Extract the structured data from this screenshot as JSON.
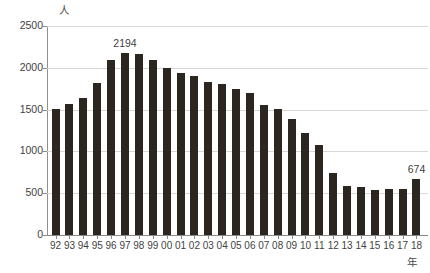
{
  "chart_data": {
    "type": "bar",
    "title": "",
    "subtitle": "",
    "xlabel": "年",
    "ylabel": "人",
    "ylim": [
      0,
      2500
    ],
    "ytick_labels": [
      "0",
      "500",
      "1000",
      "1500",
      "2000",
      "2500"
    ],
    "ytick_values": [
      0,
      500,
      1000,
      1500,
      2000,
      2500
    ],
    "grid": true,
    "legend": null,
    "categories": [
      "92",
      "93",
      "94",
      "95",
      "96",
      "97",
      "98",
      "99",
      "00",
      "01",
      "02",
      "03",
      "04",
      "05",
      "06",
      "07",
      "08",
      "09",
      "10",
      "11",
      "12",
      "13",
      "14",
      "15",
      "16",
      "17",
      "18"
    ],
    "values": [
      1502,
      1570,
      1634,
      1822,
      2097,
      2177,
      2170,
      2089,
      2002,
      1934,
      1897,
      1836,
      1812,
      1752,
      1702,
      1556,
      1512,
      1389,
      1221,
      1079,
      742,
      590,
      572,
      540,
      547,
      545,
      674
    ],
    "annotations": [
      {
        "category": "97",
        "value": 2194,
        "text": "2194"
      },
      {
        "category": "18",
        "value": 674,
        "text": "674"
      }
    ],
    "bar_color": "#2b2620",
    "grid_color": "#d8d8d8",
    "axis_color": "#8a8a8a"
  }
}
